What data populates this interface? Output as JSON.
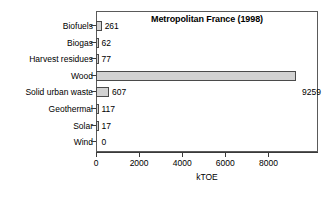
{
  "chart_data": {
    "type": "bar",
    "orientation": "horizontal",
    "title": "Metropolitan France (1998)",
    "xlabel": "kTOE",
    "ylabel": "",
    "categories": [
      "Biofuels",
      "Biogas",
      "Harvest residues",
      "Wood",
      "Solid urban waste",
      "Geothermal",
      "Solar",
      "Wind"
    ],
    "values": [
      261,
      62,
      77,
      9259,
      607,
      117,
      17,
      0
    ],
    "value_labels": [
      "261",
      "62",
      "77",
      "9259",
      "607",
      "117",
      "17",
      "0"
    ],
    "xticks": [
      0,
      2000,
      4000,
      6000,
      8000
    ],
    "xtick_labels": [
      "0",
      "2000",
      "4000",
      "6000",
      "8000"
    ],
    "xlim": [
      0,
      10300
    ],
    "grid": false,
    "legend": false,
    "bar_fill_color": "#d2d2d2",
    "bar_edge_color": "#4a4a4a",
    "frame_color": "#5a5a5a",
    "background_color": "#ffffff"
  }
}
